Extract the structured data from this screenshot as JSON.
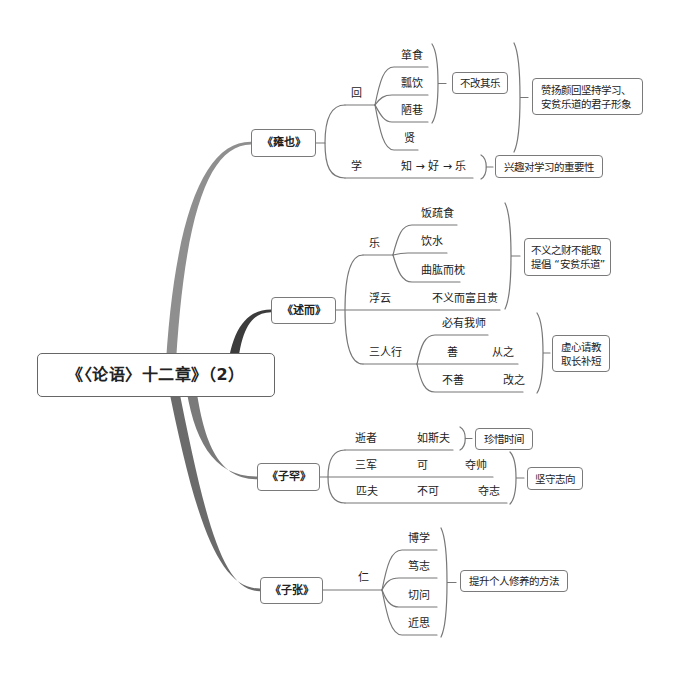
{
  "root": {
    "label": "《〈论语〉十二章》（2）"
  },
  "colors": {
    "branches": [
      "#8f8f8f",
      "#3c3c3c",
      "#7a7a7a",
      "#6b6b6b"
    ],
    "connector": "#777777",
    "box_border": "#7a7a7a",
    "text": "#222222",
    "background": "#ffffff"
  },
  "branches": [
    {
      "label": "《雍也》",
      "topics": [
        {
          "label": "回",
          "children": [
            {
              "label": "箪食"
            },
            {
              "label": "瓢饮"
            },
            {
              "label": "陋巷"
            },
            {
              "label": "贤"
            }
          ],
          "group_summary": "不改其乐"
        },
        {
          "label": "学",
          "detail": "知 → 好 → 乐",
          "summary": "兴趣对学习的重要性"
        }
      ],
      "summary": {
        "line1": "赞扬颜回坚持学习、",
        "line2": "安贫乐道的君子形象"
      }
    },
    {
      "label": "《述而》",
      "topics": [
        {
          "label": "乐",
          "children": [
            {
              "label": "饭疏食"
            },
            {
              "label": "饮水"
            },
            {
              "label": "曲肱而枕"
            }
          ]
        },
        {
          "label": "浮云",
          "detail": "不义而富且贵"
        },
        {
          "label": "三人行",
          "children": [
            {
              "label": "必有我师"
            },
            {
              "label": "善",
              "detail": "从之"
            },
            {
              "label": "不善",
              "detail": "改之"
            }
          ],
          "summary": {
            "line1": "虚心请教",
            "line2": "取长补短"
          }
        }
      ],
      "summary": {
        "line1": "不义之财不能取",
        "line2": "提倡 “安贫乐道”"
      }
    },
    {
      "label": "《子罕》",
      "topics": [
        {
          "label": "逝者",
          "detail": "如斯夫",
          "summary": "珍惜时间"
        },
        {
          "label": "三军",
          "cols": [
            "可",
            "夺帅"
          ]
        },
        {
          "label": "匹夫",
          "cols": [
            "不可",
            "夺志"
          ]
        }
      ],
      "group_summary": "坚守志向"
    },
    {
      "label": "《子张》",
      "topics": [
        {
          "label": "仁",
          "children": [
            {
              "label": "博学"
            },
            {
              "label": "笃志"
            },
            {
              "label": "切问"
            },
            {
              "label": "近思"
            }
          ]
        }
      ],
      "summary": "提升个人修养的方法"
    }
  ]
}
